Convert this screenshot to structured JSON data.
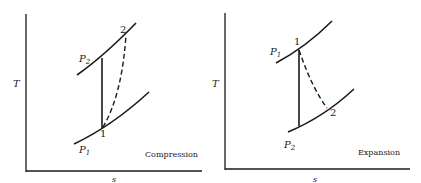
{
  "panels": [
    {
      "id": "compression",
      "title": "Compression",
      "y_axis_label": "T",
      "x_axis_label": "s",
      "upper_isobar_label": "P",
      "upper_isobar_sub": "2",
      "lower_isobar_label": "P",
      "lower_isobar_sub": "1",
      "state_1_label": "1",
      "state_2_label": "2",
      "ideal_process": "isentropic (vertical solid line)",
      "actual_process": "dashed curve from state 1 to state 2"
    },
    {
      "id": "expansion",
      "title": "Expansion",
      "y_axis_label": "T",
      "x_axis_label": "s",
      "upper_isobar_label": "P",
      "upper_isobar_sub": "1",
      "lower_isobar_label": "P",
      "lower_isobar_sub": "2",
      "state_1_label": "1",
      "state_2_label": "2",
      "ideal_process": "isentropic (vertical solid line)",
      "actual_process": "dashed curve from state 1 to state 2"
    }
  ],
  "colors": {
    "ink": "#1a1a1a",
    "background": "#ffffff"
  }
}
